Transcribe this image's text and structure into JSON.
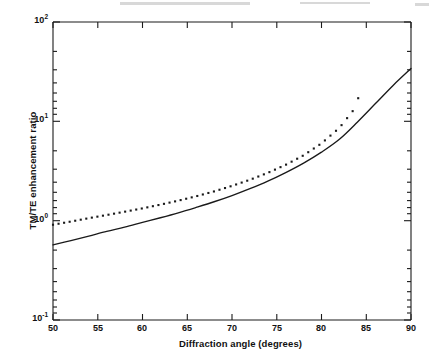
{
  "figure": {
    "title": "",
    "background": "#ffffff",
    "width": 433,
    "height": 360
  },
  "axes": {
    "x": {
      "label": "Diffraction angle (degrees)",
      "min": 50,
      "max": 90,
      "scale": "linear",
      "ticks": [
        50,
        55,
        60,
        65,
        70,
        75,
        80,
        85,
        90
      ],
      "tick_labels": [
        "50",
        "55",
        "60",
        "65",
        "70",
        "75",
        "80",
        "85",
        "90"
      ]
    },
    "y": {
      "label": "TM/TE enhancement ratio",
      "min": 0.1,
      "max": 100,
      "scale": "log",
      "ticks": [
        0.1,
        1,
        10,
        100
      ],
      "tick_labels": [
        "10",
        "10",
        "10",
        "10"
      ],
      "tick_exponents": [
        "-1",
        "0",
        "1",
        "2"
      ]
    }
  },
  "series_styles": {
    "solid": {
      "name": "solid-curve",
      "color": "#1a1a1a",
      "style": "solid",
      "width": 1.3
    },
    "dotted": {
      "name": "dotted-curve",
      "color": "#1a1a1a",
      "style": "dotted",
      "marker": "square",
      "size": 2.0
    }
  },
  "chart_data": {
    "type": "line",
    "title": "",
    "xlabel": "Diffraction angle (degrees)",
    "ylabel": "TM/TE enhancement ratio",
    "xlim": [
      50,
      90
    ],
    "ylim": [
      0.1,
      100
    ],
    "yscale": "log",
    "xscale": "linear",
    "grid": false,
    "legend": "none",
    "series": [
      {
        "name": "solid-curve",
        "style": "solid",
        "x": [
          50,
          52,
          54,
          56,
          58,
          60,
          62,
          64,
          66,
          68,
          70,
          72,
          74,
          76,
          78,
          80,
          82,
          84,
          86,
          88,
          90
        ],
        "values": [
          0.57,
          0.63,
          0.7,
          0.78,
          0.86,
          0.96,
          1.07,
          1.2,
          1.36,
          1.55,
          1.79,
          2.1,
          2.5,
          3.05,
          3.8,
          4.9,
          6.6,
          9.8,
          15.0,
          23.0,
          34.0
        ]
      },
      {
        "name": "dotted-curve",
        "style": "dotted",
        "x": [
          50,
          52,
          54,
          56,
          58,
          60,
          62,
          64,
          66,
          68,
          70,
          72,
          74,
          76,
          78,
          80,
          82,
          84,
          84.5
        ],
        "values": [
          0.91,
          0.98,
          1.06,
          1.14,
          1.23,
          1.33,
          1.45,
          1.59,
          1.76,
          1.97,
          2.24,
          2.58,
          3.03,
          3.65,
          4.55,
          6.0,
          8.6,
          14.5,
          33.0
        ]
      }
    ]
  }
}
